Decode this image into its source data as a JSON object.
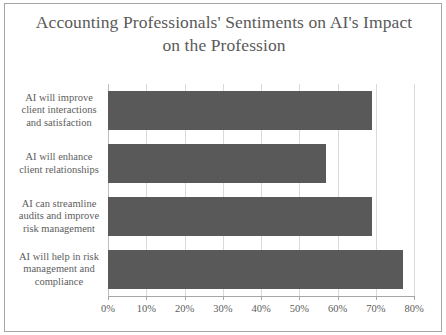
{
  "chart_data": {
    "type": "bar",
    "orientation": "horizontal",
    "title": "Accounting Professionals' Sentiments on AI's Impact on the Profession",
    "title_line_1": "Accounting Professionals' Sentiments on AI's Impact",
    "title_line_2": "on the Profession",
    "xlabel": "",
    "ylabel": "",
    "categories": [
      "AI will improve client interactions and satisfaction",
      "AI will enhance client relationships",
      "AI can streamline audits and improve risk management",
      "AI will help in risk management and compliance"
    ],
    "values": [
      69,
      57,
      69,
      77
    ],
    "value_suffix": "%",
    "xlim": [
      0,
      80
    ],
    "xtick_values": [
      0,
      10,
      20,
      30,
      40,
      50,
      60,
      70,
      80
    ],
    "xtick_labels": [
      "0%",
      "10%",
      "20%",
      "30%",
      "40%",
      "50%",
      "60%",
      "70%",
      "80%"
    ],
    "grid": true,
    "grid_axis": "x",
    "legend": false,
    "legend_position": "none",
    "bar_color": "#595959",
    "grid_color": "#d9d9d9",
    "axis_color": "#a6a6a6",
    "text_color": "#5d5d5d",
    "background_color": "#ffffff",
    "border_color": "#a6a6a6"
  }
}
